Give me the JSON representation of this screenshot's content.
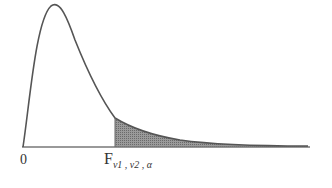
{
  "diagram": {
    "origin_label": "0",
    "critical_label": {
      "main": "F",
      "subscript": "ν1 , ν2 , α"
    },
    "colors": {
      "curve": "#555555",
      "shade": "#888888",
      "axis": "#666666"
    }
  }
}
